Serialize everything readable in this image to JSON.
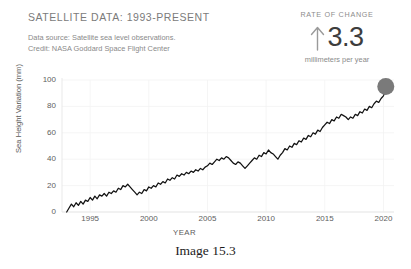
{
  "header": {
    "title": "SATELLITE DATA: 1993-PRESENT",
    "source_line": "Data source: Satellite sea level observations.",
    "credit_line": "Credit: NASA Goddard Space Flight Center"
  },
  "rate_of_change": {
    "label": "RATE OF CHANGE",
    "arrow_icon": "up-arrow-icon",
    "value": "3.3",
    "unit": "millimeters per year"
  },
  "caption": "Image 15.3",
  "colors": {
    "line": "#111111",
    "marker": "#7a7a7a",
    "tick_text": "#5e5e5e",
    "header_text": "#7b7b7b",
    "background": "#ffffff",
    "grid": "#f2f2f2"
  },
  "chart_data": {
    "type": "line",
    "title": "SATELLITE DATA: 1993-PRESENT",
    "xlabel": "YEAR",
    "ylabel": "Sea Height Variation (mm)",
    "xlim": [
      1992.6,
      2020.9
    ],
    "ylim": [
      -6,
      104
    ],
    "xticks": [
      1995,
      2000,
      2005,
      2010,
      2015,
      2020
    ],
    "yticks": [
      0,
      20,
      40,
      60,
      80,
      100
    ],
    "grid": true,
    "legend": null,
    "end_marker": {
      "x": 2020.2,
      "y": 95,
      "label": "current-value-marker"
    },
    "series": [
      {
        "name": "Sea Height Variation (mm)",
        "x": [
          1993.0,
          1993.2,
          1993.4,
          1993.6,
          1993.8,
          1994.0,
          1994.2,
          1994.4,
          1994.6,
          1994.8,
          1995.0,
          1995.2,
          1995.4,
          1995.6,
          1995.8,
          1996.0,
          1996.2,
          1996.4,
          1996.6,
          1996.8,
          1997.0,
          1997.2,
          1997.4,
          1997.6,
          1997.8,
          1998.0,
          1998.2,
          1998.4,
          1998.6,
          1998.8,
          1999.0,
          1999.2,
          1999.4,
          1999.6,
          1999.8,
          2000.0,
          2000.2,
          2000.4,
          2000.6,
          2000.8,
          2001.0,
          2001.2,
          2001.4,
          2001.6,
          2001.8,
          2002.0,
          2002.2,
          2002.4,
          2002.6,
          2002.8,
          2003.0,
          2003.2,
          2003.4,
          2003.6,
          2003.8,
          2004.0,
          2004.2,
          2004.4,
          2004.6,
          2004.8,
          2005.0,
          2005.2,
          2005.4,
          2005.6,
          2005.8,
          2006.0,
          2006.2,
          2006.4,
          2006.6,
          2006.8,
          2007.0,
          2007.2,
          2007.4,
          2007.6,
          2007.8,
          2008.0,
          2008.2,
          2008.4,
          2008.6,
          2008.8,
          2009.0,
          2009.2,
          2009.4,
          2009.6,
          2009.8,
          2010.0,
          2010.2,
          2010.4,
          2010.6,
          2010.8,
          2011.0,
          2011.2,
          2011.4,
          2011.6,
          2011.8,
          2012.0,
          2012.2,
          2012.4,
          2012.6,
          2012.8,
          2013.0,
          2013.2,
          2013.4,
          2013.6,
          2013.8,
          2014.0,
          2014.2,
          2014.4,
          2014.6,
          2014.8,
          2015.0,
          2015.2,
          2015.4,
          2015.6,
          2015.8,
          2016.0,
          2016.2,
          2016.4,
          2016.6,
          2016.8,
          2017.0,
          2017.2,
          2017.4,
          2017.6,
          2017.8,
          2018.0,
          2018.2,
          2018.4,
          2018.6,
          2018.8,
          2019.0,
          2019.2,
          2019.4,
          2019.6,
          2019.8,
          2020.0,
          2020.2
        ],
        "y": [
          0,
          3,
          6,
          4,
          7,
          5,
          8,
          6,
          9,
          8,
          11,
          9,
          12,
          10,
          13,
          12,
          14,
          12,
          15,
          14,
          16,
          15,
          18,
          17,
          20,
          19,
          21,
          19,
          17,
          15,
          13,
          15,
          14,
          17,
          16,
          19,
          18,
          20,
          19,
          22,
          21,
          23,
          22,
          25,
          24,
          26,
          25,
          28,
          27,
          29,
          28,
          30,
          29,
          31,
          30,
          32,
          31,
          33,
          32,
          34,
          35,
          37,
          36,
          38,
          40,
          39,
          41,
          40,
          42,
          41,
          39,
          37,
          36,
          38,
          37,
          35,
          33,
          35,
          37,
          39,
          41,
          40,
          43,
          42,
          45,
          44,
          47,
          45,
          44,
          42,
          40,
          43,
          45,
          48,
          47,
          50,
          49,
          52,
          51,
          54,
          53,
          56,
          55,
          58,
          57,
          60,
          59,
          62,
          61,
          64,
          66,
          68,
          67,
          70,
          69,
          72,
          71,
          74,
          73,
          72,
          70,
          72,
          71,
          74,
          73,
          76,
          75,
          78,
          77,
          80,
          79,
          82,
          84,
          83,
          86,
          88,
          92
        ]
      }
    ]
  }
}
